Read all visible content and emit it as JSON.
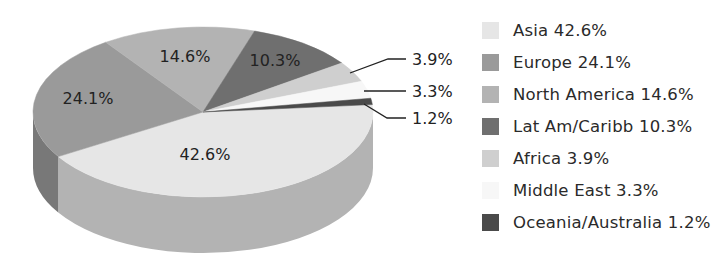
{
  "chart_data": {
    "type": "pie",
    "title": "",
    "style": "3d",
    "categories": [
      "Asia",
      "Europe",
      "North America",
      "Lat Am/Caribb",
      "Africa",
      "Middle East",
      "Oceania/Australia"
    ],
    "values": [
      42.6,
      24.1,
      14.6,
      10.3,
      3.9,
      3.3,
      1.2
    ],
    "unit": "%",
    "colors": [
      "#e6e6e6",
      "#9a9a9a",
      "#b3b3b3",
      "#6f6f6f",
      "#cfcfcf",
      "#f7f7f7",
      "#4a4a4a"
    ],
    "slice_labels": [
      "42.6%",
      "24.1%",
      "14.6%",
      "10.3%",
      "3.9%",
      "3.3%",
      "1.2%"
    ],
    "legend_position": "right"
  },
  "legend": {
    "items": [
      {
        "label": "Asia 42.6%",
        "color": "#e6e6e6"
      },
      {
        "label": "Europe 24.1%",
        "color": "#9a9a9a"
      },
      {
        "label": "North America 14.6%",
        "color": "#b3b3b3"
      },
      {
        "label": "Lat Am/Caribb 10.3%",
        "color": "#6f6f6f"
      },
      {
        "label": "Africa 3.9%",
        "color": "#cfcfcf"
      },
      {
        "label": "Middle East 3.3%",
        "color": "#f7f7f7"
      },
      {
        "label": "Oceania/Australia 1.2%",
        "color": "#4a4a4a"
      }
    ]
  }
}
